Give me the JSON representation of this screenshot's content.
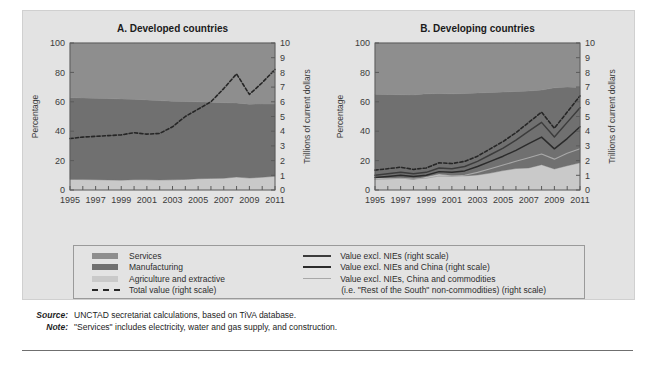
{
  "figure": {
    "background": "#e3e3e3",
    "series_colors": {
      "services": "#8e8e8e",
      "manufacturing": "#707070",
      "agriculture": "#c9c9c9",
      "total_value": "#262626",
      "excl_nies": "#3c3c3c",
      "excl_nies_china": "#2b2b2b",
      "excl_nies_china_commodities": "#a8a8a8"
    }
  },
  "legend": {
    "left_items": [
      {
        "label": "Services",
        "marker": "block",
        "color": "#8e8e8e"
      },
      {
        "label": "Manufacturing",
        "marker": "block",
        "color": "#707070"
      },
      {
        "label": "Agriculture and extractive",
        "marker": "block",
        "color": "#c9c9c9"
      },
      {
        "label": "Total value (right scale)",
        "marker": "dash",
        "color": "#262626"
      }
    ],
    "right_items": [
      {
        "label": "Value excl. NIEs (right scale)",
        "marker": "line",
        "color": "#3c3c3c"
      },
      {
        "label": "Value excl. NIEs and China (right scale)",
        "marker": "line",
        "color": "#2b2b2b"
      },
      {
        "label": "Value excl. NIEs, China and commodities",
        "marker": "line-thin",
        "color": "#a8a8a8"
      },
      {
        "label": "(i.e. \"Rest of the South\" non-commodities) (right scale)",
        "marker": "none",
        "color": ""
      }
    ]
  },
  "notes": [
    {
      "key": "Source:",
      "text": "UNCTAD secretariat calculations, based on TiVA database."
    },
    {
      "key": "Note:",
      "text": "\"Services\" includes electricity, water and gas supply, and construction."
    }
  ],
  "chart_data": [
    {
      "type": "area",
      "title": "A. Developed countries",
      "xlabel": "",
      "ylabel": "Percentage",
      "y2label": "Trillions of current dollars",
      "x": [
        1995,
        1996,
        1997,
        1998,
        1999,
        2000,
        2001,
        2002,
        2003,
        2004,
        2005,
        2006,
        2007,
        2008,
        2009,
        2010,
        2011
      ],
      "xtick_labels": [
        1995,
        1997,
        1999,
        2001,
        2003,
        2005,
        2007,
        2009,
        2011
      ],
      "ylim": [
        0,
        100
      ],
      "yticks": [
        0,
        20,
        40,
        60,
        80,
        100
      ],
      "y2lim": [
        0,
        10
      ],
      "y2ticks": [
        0,
        1,
        2,
        3,
        4,
        5,
        6,
        7,
        8,
        9,
        10
      ],
      "grid": false,
      "legend_position": "below",
      "stacked_series": [
        {
          "name": "Agriculture and extractive",
          "color": "#c9c9c9",
          "values": [
            7.2,
            7.1,
            7.0,
            6.8,
            6.7,
            7.0,
            6.9,
            6.8,
            6.9,
            7.2,
            7.6,
            7.9,
            8.0,
            8.8,
            8.1,
            8.7,
            9.3
          ]
        },
        {
          "name": "Manufacturing",
          "color": "#707070",
          "values": [
            55.6,
            55.5,
            55.5,
            55.4,
            55.2,
            54.8,
            54.4,
            54.0,
            53.5,
            53.0,
            52.4,
            51.8,
            51.4,
            50.4,
            50.3,
            49.8,
            49.2
          ]
        },
        {
          "name": "Services",
          "color": "#8e8e8e",
          "values": [
            37.2,
            37.4,
            37.5,
            37.8,
            38.1,
            38.2,
            38.7,
            39.2,
            39.6,
            39.8,
            40.0,
            40.3,
            40.6,
            40.8,
            41.6,
            41.5,
            41.5
          ]
        }
      ],
      "line_series": [
        {
          "name": "Total value (right scale)",
          "color": "#262626",
          "style": "dashed",
          "axis": "right",
          "values": [
            3.5,
            3.6,
            3.65,
            3.7,
            3.75,
            3.9,
            3.8,
            3.85,
            4.3,
            5.0,
            5.5,
            6.0,
            6.9,
            7.9,
            6.5,
            7.3,
            8.2
          ]
        }
      ]
    },
    {
      "type": "area",
      "title": "B. Developing countries",
      "xlabel": "",
      "ylabel": "Percentage",
      "y2label": "Trillions of current dollars",
      "x": [
        1995,
        1996,
        1997,
        1998,
        1999,
        2000,
        2001,
        2002,
        2003,
        2004,
        2005,
        2006,
        2007,
        2008,
        2009,
        2010,
        2011
      ],
      "xtick_labels": [
        1995,
        1997,
        1999,
        2001,
        2003,
        2005,
        2007,
        2009,
        2011
      ],
      "ylim": [
        0,
        100
      ],
      "yticks": [
        0,
        20,
        40,
        60,
        80,
        100
      ],
      "y2lim": [
        0,
        10
      ],
      "y2ticks": [
        0,
        1,
        2,
        3,
        4,
        5,
        6,
        7,
        8,
        9,
        10
      ],
      "grid": false,
      "legend_position": "below",
      "stacked_series": [
        {
          "name": "Agriculture and extractive",
          "color": "#c9c9c9",
          "values": [
            8.4,
            8.0,
            8.2,
            7.2,
            9.0,
            10.8,
            9.8,
            9.6,
            10.2,
            11.5,
            13.2,
            14.6,
            15.0,
            17.2,
            14.3,
            16.5,
            18.5
          ]
        },
        {
          "name": "Manufacturing",
          "color": "#707070",
          "values": [
            56.8,
            57.0,
            56.6,
            57.5,
            56.4,
            54.8,
            55.6,
            56.0,
            55.8,
            54.9,
            53.4,
            52.4,
            52.4,
            50.8,
            55.2,
            53.5,
            51.2
          ]
        },
        {
          "name": "Services",
          "color": "#8e8e8e",
          "values": [
            34.8,
            35.0,
            35.2,
            35.3,
            34.6,
            34.4,
            34.6,
            34.4,
            34.0,
            33.6,
            33.4,
            33.0,
            32.6,
            32.0,
            30.5,
            30.0,
            30.3
          ]
        }
      ],
      "line_series": [
        {
          "name": "Total value (right scale)",
          "color": "#262626",
          "style": "dashed",
          "axis": "right",
          "values": [
            1.35,
            1.45,
            1.55,
            1.4,
            1.5,
            1.85,
            1.8,
            1.95,
            2.3,
            2.8,
            3.3,
            3.9,
            4.6,
            5.3,
            4.2,
            5.3,
            6.4
          ]
        },
        {
          "name": "Value excl. NIEs (right scale)",
          "color": "#3c3c3c",
          "style": "solid",
          "axis": "right",
          "values": [
            1.0,
            1.1,
            1.2,
            1.1,
            1.2,
            1.5,
            1.45,
            1.6,
            1.95,
            2.4,
            2.85,
            3.4,
            4.0,
            4.6,
            3.6,
            4.6,
            5.6
          ]
        },
        {
          "name": "Value excl. NIEs and China (right scale)",
          "color": "#2b2b2b",
          "style": "solid",
          "axis": "right",
          "values": [
            0.85,
            0.92,
            1.0,
            0.92,
            1.0,
            1.25,
            1.2,
            1.3,
            1.6,
            1.95,
            2.3,
            2.7,
            3.15,
            3.6,
            2.8,
            3.5,
            4.3
          ]
        },
        {
          "name": "Value excl. NIEs, China and commodities (right scale)",
          "color": "#a8a8a8",
          "style": "solid",
          "axis": "right",
          "values": [
            0.72,
            0.76,
            0.8,
            0.75,
            0.8,
            0.95,
            0.93,
            1.0,
            1.2,
            1.45,
            1.7,
            1.95,
            2.2,
            2.45,
            2.1,
            2.5,
            2.8
          ]
        }
      ]
    }
  ]
}
